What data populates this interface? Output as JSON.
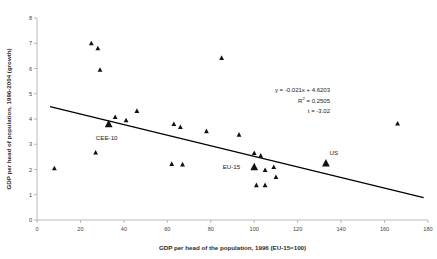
{
  "chart_data": {
    "type": "scatter",
    "title": "",
    "xlabel": "GDP per head of the population, 1996 (EU-15=100)",
    "ylabel": "GDP per head of population, 1996-2004 (growth)",
    "xlim": [
      0,
      180
    ],
    "ylim": [
      0,
      8
    ],
    "xticks": [
      0,
      20,
      40,
      60,
      80,
      100,
      120,
      140,
      160,
      180
    ],
    "yticks": [
      0,
      1,
      2,
      3,
      4,
      5,
      6,
      7,
      8
    ],
    "grid": false,
    "legend": "none",
    "marker_shape": "triangle",
    "marker_color": "#111111",
    "points": [
      {
        "x": 8,
        "y": 2.05,
        "label": ""
      },
      {
        "x": 25,
        "y": 7.0,
        "label": ""
      },
      {
        "x": 28,
        "y": 6.8,
        "label": ""
      },
      {
        "x": 29,
        "y": 5.95,
        "label": ""
      },
      {
        "x": 27,
        "y": 2.67,
        "label": ""
      },
      {
        "x": 33,
        "y": 3.8,
        "label": "CEE-10",
        "emphasis": true
      },
      {
        "x": 36,
        "y": 4.08,
        "label": ""
      },
      {
        "x": 41,
        "y": 3.95,
        "label": ""
      },
      {
        "x": 46,
        "y": 4.32,
        "label": ""
      },
      {
        "x": 62,
        "y": 2.22,
        "label": ""
      },
      {
        "x": 63,
        "y": 3.8,
        "label": ""
      },
      {
        "x": 66,
        "y": 3.68,
        "label": ""
      },
      {
        "x": 67,
        "y": 2.2,
        "label": ""
      },
      {
        "x": 78,
        "y": 3.52,
        "label": ""
      },
      {
        "x": 85,
        "y": 6.42,
        "label": ""
      },
      {
        "x": 93,
        "y": 3.38,
        "label": ""
      },
      {
        "x": 100,
        "y": 2.65,
        "label": ""
      },
      {
        "x": 100,
        "y": 2.1,
        "label": "EU-15",
        "emphasis": true
      },
      {
        "x": 101,
        "y": 1.38,
        "label": ""
      },
      {
        "x": 103,
        "y": 2.55,
        "label": ""
      },
      {
        "x": 105,
        "y": 1.38,
        "label": ""
      },
      {
        "x": 105,
        "y": 1.98,
        "label": ""
      },
      {
        "x": 109,
        "y": 2.1,
        "label": ""
      },
      {
        "x": 110,
        "y": 1.7,
        "label": ""
      },
      {
        "x": 133,
        "y": 2.25,
        "label": "US",
        "emphasis": true
      },
      {
        "x": 166,
        "y": 3.82,
        "label": ""
      }
    ],
    "trendline": {
      "slope": -0.021,
      "intercept": 4.6203,
      "x_start": 6,
      "x_end": 178
    },
    "annotations": {
      "equation": "y = -0.021x + 4.6203",
      "r_squared_prefix": "R",
      "r_squared_sup": "2",
      "r_squared_value": " = 0.2505",
      "t_stat": "t = -3.02"
    },
    "point_labels": {
      "cee10": "CEE-10",
      "eu15": "EU-15",
      "us": "US"
    }
  }
}
